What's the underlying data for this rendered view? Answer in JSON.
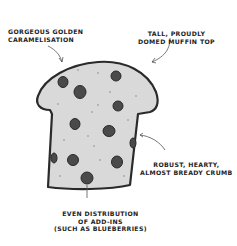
{
  "diagram": {
    "subject": "muffin",
    "annotations": [
      {
        "id": "golden",
        "lines": [
          "Gorgeous golden",
          "caramelisation"
        ]
      },
      {
        "id": "dome",
        "lines": [
          "Tall, proudly",
          "domed muffin top"
        ]
      },
      {
        "id": "crumb",
        "lines": [
          "Robust, hearty,",
          "almost bready crumb"
        ]
      },
      {
        "id": "addins",
        "lines": [
          "Even distribution",
          "of add-ins",
          "(such as blueberries)"
        ]
      }
    ],
    "colors": {
      "outline": "#2a2a2a",
      "muffin_fill": "#d9d9d9",
      "berry": "#4a4a4a",
      "text": "#1e1e1e"
    }
  }
}
